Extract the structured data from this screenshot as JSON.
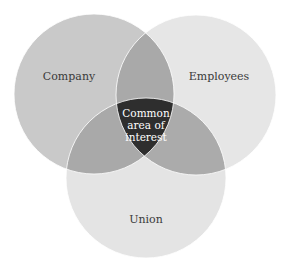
{
  "diagram": {
    "type": "venn",
    "sets": [
      {
        "id": "company",
        "label": "Company",
        "color": "#c9c9c9"
      },
      {
        "id": "employees",
        "label": "Employees",
        "color": "#e6e6e6"
      },
      {
        "id": "union",
        "label": "Union",
        "color": "#e4e4e4"
      }
    ],
    "overlap_color": "#a9a9a9",
    "center": {
      "lines": [
        "Common",
        "area of",
        "interest"
      ],
      "color": "#2e2e2e",
      "text_color": "#ffffff"
    }
  }
}
